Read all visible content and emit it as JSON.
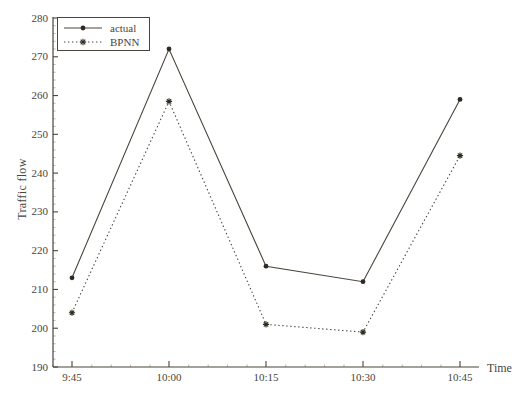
{
  "chart_data": {
    "type": "line",
    "title": "",
    "xlabel": "Time",
    "ylabel": "Traffic flow",
    "categories": [
      "9:45",
      "10:00",
      "10:15",
      "10:30",
      "10:45"
    ],
    "series": [
      {
        "name": "actual",
        "line": "solid",
        "marker": "dot",
        "values": [
          213,
          272,
          216,
          212,
          259
        ]
      },
      {
        "name": "BPNN",
        "line": "dotted",
        "marker": "asterisk",
        "values": [
          204,
          258.5,
          201,
          199,
          244.5
        ]
      }
    ],
    "ylim": [
      190,
      280
    ],
    "yticks": [
      190,
      200,
      210,
      220,
      230,
      240,
      250,
      260,
      270,
      280
    ],
    "grid": false,
    "legend_position": "top-left"
  },
  "colors": {
    "ink": "#4a453b",
    "background": "#ffffff"
  }
}
